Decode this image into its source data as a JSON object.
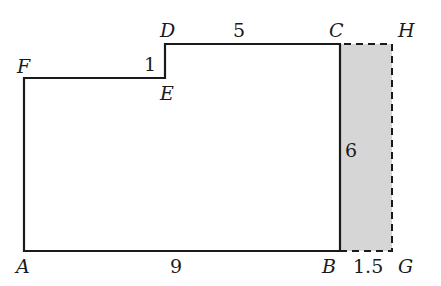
{
  "diagram": {
    "type": "geometry-figure",
    "colors": {
      "stroke": "#1a1a1a",
      "shade": "#d6d6d6",
      "background": "#ffffff"
    },
    "points": {
      "A": {
        "label": "A",
        "x": 24,
        "y": 251
      },
      "B": {
        "label": "B",
        "x": 340,
        "y": 251
      },
      "C": {
        "label": "C",
        "x": 340,
        "y": 44
      },
      "D": {
        "label": "D",
        "x": 165,
        "y": 44
      },
      "E": {
        "label": "E",
        "x": 165,
        "y": 78
      },
      "F": {
        "label": "F",
        "x": 24,
        "y": 78
      },
      "G": {
        "label": "G",
        "x": 392,
        "y": 251
      },
      "H": {
        "label": "H",
        "x": 392,
        "y": 44
      }
    },
    "solid_outline": [
      "A",
      "B",
      "C",
      "D",
      "E",
      "F"
    ],
    "dashed_outline": [
      "B",
      "G",
      "H",
      "C"
    ],
    "shaded_region": [
      "B",
      "G",
      "H",
      "C"
    ],
    "measurements": {
      "AB": "9",
      "BC": "6",
      "DC": "5",
      "DE": "1",
      "BG": "1.5"
    }
  }
}
